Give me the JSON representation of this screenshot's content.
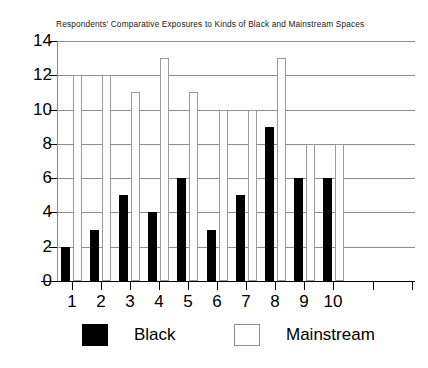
{
  "chart_data": {
    "type": "bar",
    "title": "Respondents' Comparative Exposures to Kinds of Black and Mainstream Spaces",
    "xlabel": "",
    "ylabel": "",
    "categories": [
      "1",
      "2",
      "3",
      "4",
      "5",
      "6",
      "7",
      "8",
      "9",
      "10"
    ],
    "series": [
      {
        "name": "Black",
        "color": "#000000",
        "values": [
          2,
          3,
          5,
          4,
          6,
          3,
          5,
          9,
          6,
          6
        ]
      },
      {
        "name": "Mainstream",
        "color": "#ffffff",
        "values": [
          12,
          12,
          11,
          13,
          11,
          10,
          10,
          13,
          8,
          8
        ]
      }
    ],
    "ylim": [
      0,
      14
    ],
    "yticks": [
      0,
      2,
      4,
      6,
      8,
      10,
      12,
      14
    ],
    "ytick_labels": [
      "0",
      "2",
      "4",
      "6",
      "8",
      "10",
      "12",
      "14"
    ],
    "grid": true,
    "grid_axis": "y",
    "legend_position": "bottom",
    "extra_unlabeled_xticks": 2
  },
  "legend": {
    "entries": [
      {
        "label": "Black",
        "swatch": "filled-black-square"
      },
      {
        "label": "Mainstream",
        "swatch": "open-white-square"
      }
    ]
  },
  "colors": {
    "black_series": "#000000",
    "mainstream_series": "#ffffff",
    "mainstream_border": "#9a9a9a",
    "gridline": "#8c8c8c",
    "axis": "#000000",
    "text": "#000000",
    "title_text": "#1a1a1a",
    "background": "#ffffff"
  }
}
